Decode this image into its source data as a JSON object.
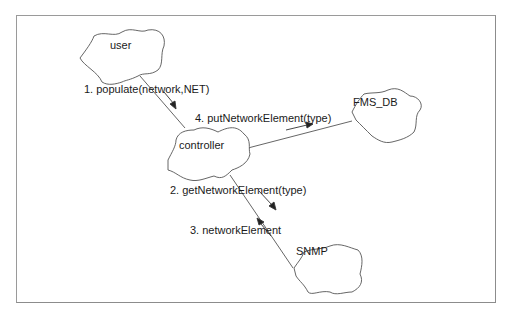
{
  "diagram": {
    "type": "collaboration-diagram",
    "nodes": [
      {
        "id": "user",
        "label": "user"
      },
      {
        "id": "controller",
        "label": "controller"
      },
      {
        "id": "fms_db",
        "label": "FMS_DB"
      },
      {
        "id": "snmp",
        "label": "SNMP"
      }
    ],
    "links": [
      {
        "from": "user",
        "to": "controller"
      },
      {
        "from": "controller",
        "to": "fms_db"
      },
      {
        "from": "controller",
        "to": "snmp"
      }
    ],
    "messages": [
      {
        "seq": 1,
        "label": "1. populate(network,NET)",
        "from": "user",
        "to": "controller"
      },
      {
        "seq": 2,
        "label": "2. getNetworkElement(type)",
        "from": "controller",
        "to": "snmp"
      },
      {
        "seq": 3,
        "label": "3. networkElement",
        "from": "snmp",
        "to": "controller"
      },
      {
        "seq": 4,
        "label": "4. putNetworkElement(type)",
        "from": "controller",
        "to": "fms_db"
      }
    ],
    "colors": {
      "line": "#555555",
      "frame": "#9a9a9a",
      "background": "#ffffff"
    }
  }
}
